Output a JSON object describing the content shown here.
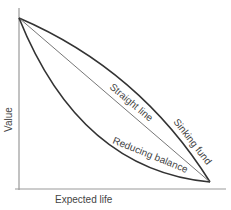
{
  "diagram": {
    "type": "depreciation-curves",
    "axes": {
      "y_label": "Value",
      "x_label": "Expected life"
    },
    "curves": [
      {
        "name": "Straight line",
        "shape": "linear"
      },
      {
        "name": "Sinking fund",
        "shape": "concave"
      },
      {
        "name": "Reducing balance",
        "shape": "convex"
      }
    ],
    "colors": {
      "axis": "#999999",
      "curve": "#333333",
      "straight": "#777777",
      "text": "#444444"
    }
  }
}
